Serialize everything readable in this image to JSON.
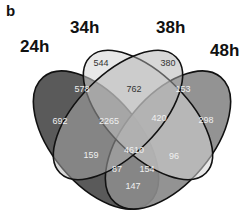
{
  "panel_label": "b",
  "sets": [
    {
      "name": "24h",
      "color": "#5a5a5a"
    },
    {
      "name": "34h",
      "color": "#d6d6d6"
    },
    {
      "name": "38h",
      "color": "#a8a8a8"
    },
    {
      "name": "48h",
      "color": "#8a8a8a"
    }
  ],
  "regions": {
    "only_34h": "544",
    "only_38h": "380",
    "24h_34h": "578",
    "34h_38h": "762",
    "38h_48h": "153",
    "only_24h": "692",
    "24h_34h_38h": "2265",
    "34h_38h_48h": "420",
    "only_48h": "298",
    "24h_38h": "159",
    "all_four": "4610",
    "34h_48h": "96",
    "24h_38h_48h": "87",
    "24h_34h_48h": "154",
    "24h_48h": "147"
  }
}
